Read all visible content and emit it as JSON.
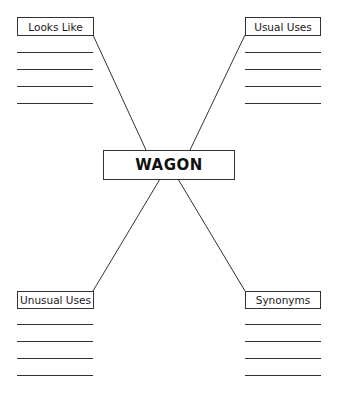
{
  "center": {
    "label": "WAGON"
  },
  "quadrants": [
    {
      "id": "top-left",
      "label": "Looks Like",
      "blank_lines": 4
    },
    {
      "id": "top-right",
      "label": "Usual Uses",
      "blank_lines": 4
    },
    {
      "id": "bottom-left",
      "label": "Unusual Uses",
      "blank_lines": 4
    },
    {
      "id": "bottom-right",
      "label": "Synonyms",
      "blank_lines": 4
    }
  ],
  "colors": {
    "stroke": "#333333",
    "text": "#1a1a1a",
    "background": "#ffffff"
  }
}
